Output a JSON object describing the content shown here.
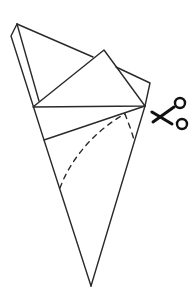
{
  "diagram": {
    "line_color": "#2a2a2a",
    "background": "#ffffff",
    "elements": {
      "scissors_icon": "scissors-icon",
      "cut_line": "dashed-curve",
      "folded_flap": "folded-triangle-flap",
      "cone": "paper-cone"
    }
  }
}
